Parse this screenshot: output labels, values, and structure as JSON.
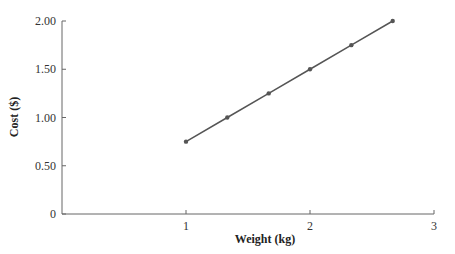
{
  "chart_data": {
    "type": "line",
    "title": "",
    "xlabel": "Weight (kg)",
    "ylabel": "Cost ($)",
    "x": [
      1,
      1.333,
      1.667,
      2,
      2.333,
      2.667
    ],
    "series": [
      {
        "name": "Cost",
        "values": [
          0.75,
          1.0,
          1.25,
          1.5,
          1.75,
          2.0
        ]
      }
    ],
    "xlim": [
      0,
      3
    ],
    "ylim": [
      0,
      2.0
    ],
    "xticks": [
      "1",
      "2",
      "3"
    ],
    "yticks": [
      "0",
      "0.50",
      "1.00",
      "1.50",
      "2.00"
    ],
    "grid": false,
    "legend": "none",
    "line_color": "#555555"
  }
}
